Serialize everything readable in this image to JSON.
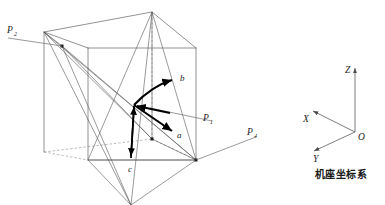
{
  "figure": {
    "title": "机座坐标系",
    "caption": "机座坐标系",
    "colors": {
      "cube_edge": "#6e6e6e",
      "hidden_edge": "#8c8c8c",
      "diagonal": "#555555",
      "vector": "#000000",
      "leader": "#6e6e6e",
      "axis": "#6e6e6e",
      "text": "#1a1a1a",
      "background": "#ffffff"
    }
  },
  "cube": {
    "name": "wireframe-cube",
    "projection": "oblique",
    "vertices": {
      "front_top_left": [
        88,
        48
      ],
      "front_top_right": [
        196,
        48
      ],
      "front_bottom_left": [
        88,
        160
      ],
      "front_bottom_right": [
        196,
        160
      ],
      "back_top_left": [
        44,
        32
      ],
      "back_top_right": [
        152,
        12
      ],
      "back_bottom_left": [
        44,
        152
      ],
      "back_bottom_right": [
        152,
        139
      ]
    }
  },
  "points": [
    {
      "id": "P2",
      "base": "P",
      "sub": "2",
      "label_x": 6,
      "label_y": 35,
      "leader_from": [
        20,
        39
      ],
      "leader_to": [
        44,
        33
      ]
    },
    {
      "id": "P1",
      "base": "P",
      "sub": "1",
      "label_x": 201,
      "label_y": 120,
      "leader_from": [
        198,
        117
      ],
      "leader_to": [
        150,
        107
      ]
    },
    {
      "id": "P4",
      "base": "P",
      "sub": "4",
      "label_x": 245,
      "label_y": 135,
      "leader_from": [
        243,
        137
      ],
      "leader_to": [
        196,
        160
      ]
    }
  ],
  "vectors": [
    {
      "id": "a",
      "label": "a",
      "origin": [
        134,
        105
      ],
      "tip": [
        172,
        131
      ],
      "label_x": 176,
      "label_y": 137
    },
    {
      "id": "b",
      "label": "b",
      "origin": [
        134,
        105
      ],
      "tip": [
        174,
        79
      ],
      "label_x": 179,
      "label_y": 80
    },
    {
      "id": "c",
      "label": "c",
      "origin": [
        134,
        105
      ],
      "tip": [
        131,
        158
      ],
      "label_x": 131,
      "label_y": 170
    },
    {
      "id": "p1_in",
      "label": "",
      "origin": [
        170,
        113
      ],
      "tip": [
        136,
        107
      ],
      "label_x": 0,
      "label_y": 0
    }
  ],
  "coordinate_frame": {
    "name": "机座坐标系",
    "origin": {
      "label": "O",
      "x": 356,
      "y": 134
    },
    "axes": [
      {
        "id": "Z",
        "label": "Z",
        "from": [
          355,
          132
        ],
        "to": [
          355,
          66
        ],
        "label_x": 347,
        "label_y": 71
      },
      {
        "id": "X",
        "label": "X",
        "from": [
          355,
          132
        ],
        "to": [
          311,
          110
        ],
        "label_x": 306,
        "label_y": 120
      },
      {
        "id": "Y",
        "label": "Y",
        "from": [
          355,
          132
        ],
        "to": [
          312,
          151
        ],
        "label_x": 313,
        "label_y": 161
      }
    ]
  }
}
